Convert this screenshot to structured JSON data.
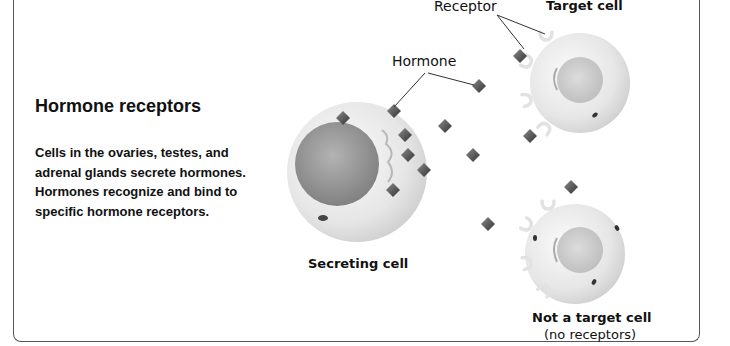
{
  "panel": {
    "title": "Hormone receptors",
    "description": "Cells in the ovaries, testes, and adrenal glands secrete hormones. Hormones recognize and bind to specific hormone receptors."
  },
  "diagram": {
    "labels": {
      "receptor": "Receptor",
      "hormone": "Hormone",
      "target_cell": "Target cell",
      "secreting_cell": "Secreting cell",
      "not_target_cell": "Not a target cell",
      "not_target_note": "(no receptors)"
    },
    "colors": {
      "cell_body": "#ececec",
      "nucleus": "#9a9a9a",
      "hormone": "#555555",
      "frame": "#555555"
    }
  }
}
